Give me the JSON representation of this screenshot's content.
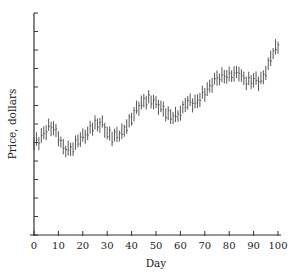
{
  "chart_data": {
    "type": "line",
    "subtype": "high-low bar (OHLC-style) daily price chart",
    "title": "",
    "xlabel": "Day",
    "ylabel": "Price, dollars",
    "xlim": [
      0,
      100
    ],
    "ylim": [
      0,
      12
    ],
    "x_ticks": [
      0,
      10,
      20,
      30,
      40,
      50,
      60,
      70,
      80,
      90,
      100
    ],
    "y_ticks_count": 12,
    "y_ticks_labeled": false,
    "grid": false,
    "legend": null,
    "x": [
      0,
      2,
      4,
      6,
      8,
      10,
      12,
      14,
      16,
      18,
      20,
      22,
      24,
      26,
      28,
      30,
      32,
      34,
      36,
      38,
      40,
      42,
      44,
      46,
      48,
      50,
      52,
      54,
      56,
      58,
      60,
      62,
      64,
      66,
      68,
      70,
      72,
      74,
      76,
      78,
      80,
      82,
      84,
      86,
      88,
      90,
      92,
      94,
      96,
      98,
      100
    ],
    "series": [
      {
        "name": "Price",
        "values": [
          5.0,
          5.1,
          5.5,
          5.8,
          5.8,
          5.3,
          4.7,
          4.6,
          4.7,
          5.1,
          5.3,
          5.5,
          5.9,
          6.0,
          6.0,
          5.5,
          5.3,
          5.4,
          5.5,
          5.9,
          6.3,
          6.8,
          7.1,
          7.3,
          7.3,
          7.1,
          6.9,
          6.6,
          6.4,
          6.4,
          6.6,
          7.1,
          7.2,
          7.1,
          7.4,
          7.7,
          8.0,
          8.4,
          8.5,
          8.6,
          8.6,
          8.7,
          8.8,
          8.4,
          8.3,
          8.4,
          8.3,
          8.5,
          9.2,
          9.9,
          10.2
        ]
      }
    ],
    "bar_half_range": 0.35
  },
  "axes": {
    "x_tick_labels": [
      "0",
      "10",
      "20",
      "30",
      "40",
      "50",
      "60",
      "70",
      "80",
      "90",
      "100"
    ],
    "x_title": "Day",
    "y_title": "Price, dollars"
  }
}
